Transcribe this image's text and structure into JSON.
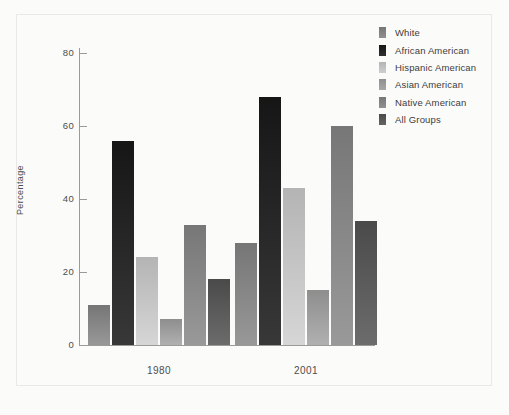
{
  "chart_data": {
    "type": "bar",
    "title": "",
    "subtitle": "",
    "xlabel": "",
    "ylabel": "Percentage",
    "categories": [
      "1980",
      "2001"
    ],
    "ylim": [
      0,
      85
    ],
    "yticks": [
      0,
      20,
      40,
      60,
      80
    ],
    "ytick_labels": [
      "0",
      "20",
      "40",
      "60",
      "80"
    ],
    "grid": false,
    "legend_position": "top-right",
    "series": [
      {
        "name": "White",
        "values": [
          11,
          28
        ],
        "color": "#767676"
      },
      {
        "name": "African American",
        "values": [
          56,
          68
        ],
        "color": "#161616"
      },
      {
        "name": "Hispanic American",
        "values": [
          24,
          43
        ],
        "color": "#b4b4b4"
      },
      {
        "name": "Asian American",
        "values": [
          7,
          15
        ],
        "color": "#8e8e8e"
      },
      {
        "name": "Native American",
        "values": [
          33,
          60
        ],
        "color": "#777777"
      },
      {
        "name": "All Groups",
        "values": [
          18,
          34
        ],
        "color": "#4a4a4a"
      }
    ]
  },
  "legend": {
    "items": [
      {
        "label": "White"
      },
      {
        "label": "African American"
      },
      {
        "label": "Hispanic American"
      },
      {
        "label": "Asian American"
      },
      {
        "label": "Native American"
      },
      {
        "label": "All Groups"
      }
    ]
  },
  "axes": {
    "y_title": "Percentage",
    "y_tick_labels": [
      "80",
      "60",
      "40",
      "20",
      "0"
    ],
    "x_tick_labels": [
      "1980",
      "2001"
    ]
  },
  "style": {
    "background": "#fbfbfa",
    "axis_color": "#9a9a98",
    "text_color": "#4d4d4d",
    "frame_color": "#e9e9e7"
  }
}
